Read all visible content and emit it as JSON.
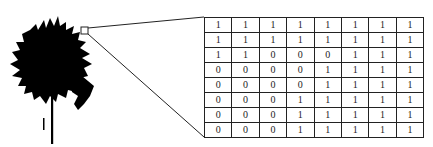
{
  "figure": {
    "left_image": "tree-silhouette",
    "zoom_box": "magnified-region-marker",
    "grid": [
      [
        "1",
        "1",
        "1",
        "1",
        "1",
        "1",
        "1",
        "1"
      ],
      [
        "1",
        "1",
        "1",
        "1",
        "1",
        "1",
        "1",
        "1"
      ],
      [
        "1",
        "1",
        "0",
        "0",
        "0",
        "1",
        "1",
        "1"
      ],
      [
        "0",
        "0",
        "0",
        "0",
        "1",
        "1",
        "1",
        "1"
      ],
      [
        "0",
        "0",
        "0",
        "0",
        "1",
        "1",
        "1",
        "1"
      ],
      [
        "0",
        "0",
        "0",
        "1",
        "1",
        "1",
        "1",
        "1"
      ],
      [
        "0",
        "0",
        "0",
        "1",
        "1",
        "1",
        "1",
        "1"
      ],
      [
        "0",
        "0",
        "0",
        "1",
        "1",
        "1",
        "1",
        "1"
      ]
    ]
  }
}
